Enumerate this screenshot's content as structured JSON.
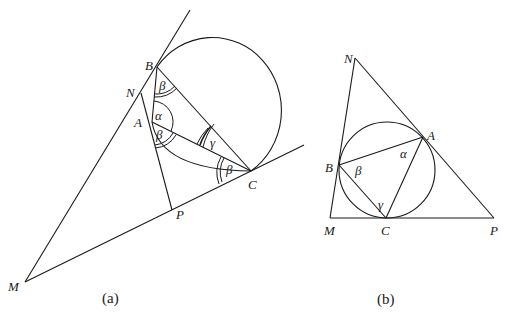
{
  "figure_a": {
    "caption": "(a)",
    "points": {
      "B": "B",
      "N": "N",
      "A": "A",
      "C": "C",
      "P": "P",
      "M": "M"
    },
    "angles": {
      "beta_at_B": "β",
      "alpha_at_A": "α",
      "beta_at_A": "β",
      "gamma_at_C": "γ",
      "beta_at_C": "β"
    }
  },
  "figure_b": {
    "caption": "(b)",
    "points": {
      "N": "N",
      "A": "A",
      "B": "B",
      "M": "M",
      "C": "C",
      "P": "P"
    },
    "angles": {
      "alpha_at_A": "α",
      "beta_at_B": "β",
      "gamma_at_C": "γ"
    }
  }
}
